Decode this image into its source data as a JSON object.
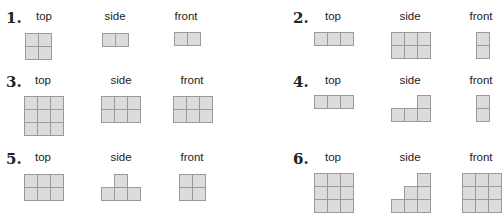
{
  "labels": {
    "top": "top",
    "side": "side",
    "front": "front"
  },
  "problems": [
    {
      "number": "1.",
      "num_pos": [
        6,
        9
      ],
      "label_y": 10,
      "views": [
        {
          "name": "top",
          "label_x": 44,
          "x": 25,
          "y": 33,
          "cells": [
            [
              0,
              0
            ],
            [
              1,
              0
            ],
            [
              0,
              1
            ],
            [
              1,
              1
            ]
          ]
        },
        {
          "name": "side",
          "label_x": 115,
          "x": 102,
          "y": 33,
          "cells": [
            [
              0,
              0
            ],
            [
              1,
              0
            ]
          ]
        },
        {
          "name": "front",
          "label_x": 186,
          "x": 174,
          "y": 32,
          "cells": [
            [
              0,
              0
            ],
            [
              1,
              0
            ]
          ]
        }
      ]
    },
    {
      "number": "2.",
      "num_pos": [
        293,
        9
      ],
      "label_y": 10,
      "views": [
        {
          "name": "top",
          "label_x": 333,
          "x": 314,
          "y": 32,
          "cells": [
            [
              0,
              0
            ],
            [
              1,
              0
            ],
            [
              2,
              0
            ]
          ]
        },
        {
          "name": "side",
          "label_x": 410,
          "x": 391,
          "y": 32,
          "cells": [
            [
              0,
              0
            ],
            [
              1,
              0
            ],
            [
              2,
              0
            ],
            [
              0,
              1
            ],
            [
              1,
              1
            ],
            [
              2,
              1
            ]
          ]
        },
        {
          "name": "front",
          "label_x": 481,
          "x": 476,
          "y": 32,
          "cells": [
            [
              0,
              0
            ],
            [
              0,
              1
            ]
          ]
        }
      ]
    },
    {
      "number": "3.",
      "num_pos": [
        6,
        73
      ],
      "label_y": 74,
      "views": [
        {
          "name": "top",
          "label_x": 43,
          "x": 24,
          "y": 96,
          "cells": [
            [
              0,
              0
            ],
            [
              1,
              0
            ],
            [
              2,
              0
            ],
            [
              0,
              1
            ],
            [
              1,
              1
            ],
            [
              2,
              1
            ],
            [
              0,
              2
            ],
            [
              1,
              2
            ],
            [
              2,
              2
            ]
          ]
        },
        {
          "name": "side",
          "label_x": 121,
          "x": 101,
          "y": 96,
          "cells": [
            [
              0,
              0
            ],
            [
              1,
              0
            ],
            [
              2,
              0
            ],
            [
              0,
              1
            ],
            [
              1,
              1
            ],
            [
              2,
              1
            ]
          ]
        },
        {
          "name": "front",
          "label_x": 192,
          "x": 173,
          "y": 96,
          "cells": [
            [
              0,
              0
            ],
            [
              1,
              0
            ],
            [
              2,
              0
            ],
            [
              0,
              1
            ],
            [
              1,
              1
            ],
            [
              2,
              1
            ]
          ]
        }
      ]
    },
    {
      "number": "4.",
      "num_pos": [
        293,
        73
      ],
      "label_y": 74,
      "views": [
        {
          "name": "top",
          "label_x": 333,
          "x": 314,
          "y": 95,
          "cells": [
            [
              0,
              0
            ],
            [
              1,
              0
            ],
            [
              2,
              0
            ]
          ]
        },
        {
          "name": "side",
          "label_x": 410,
          "x": 391,
          "y": 95,
          "cells": [
            [
              2,
              0
            ],
            [
              0,
              1
            ],
            [
              1,
              1
            ],
            [
              2,
              1
            ]
          ]
        },
        {
          "name": "front",
          "label_x": 481,
          "x": 476,
          "y": 95,
          "cells": [
            [
              0,
              0
            ],
            [
              0,
              1
            ]
          ]
        }
      ]
    },
    {
      "number": "5.",
      "num_pos": [
        6,
        150
      ],
      "label_y": 151,
      "views": [
        {
          "name": "top",
          "label_x": 43,
          "x": 24,
          "y": 174,
          "cells": [
            [
              0,
              0
            ],
            [
              1,
              0
            ],
            [
              2,
              0
            ],
            [
              0,
              1
            ],
            [
              1,
              1
            ],
            [
              2,
              1
            ]
          ]
        },
        {
          "name": "side",
          "label_x": 121,
          "x": 101,
          "y": 174,
          "cells": [
            [
              1,
              0
            ],
            [
              0,
              1
            ],
            [
              1,
              1
            ],
            [
              2,
              1
            ]
          ]
        },
        {
          "name": "front",
          "label_x": 192,
          "x": 179,
          "y": 174,
          "cells": [
            [
              0,
              0
            ],
            [
              1,
              0
            ],
            [
              0,
              1
            ],
            [
              1,
              1
            ]
          ]
        }
      ]
    },
    {
      "number": "6.",
      "num_pos": [
        293,
        150
      ],
      "label_y": 151,
      "views": [
        {
          "name": "top",
          "label_x": 333,
          "x": 314,
          "y": 173,
          "cells": [
            [
              0,
              0
            ],
            [
              1,
              0
            ],
            [
              2,
              0
            ],
            [
              0,
              1
            ],
            [
              1,
              1
            ],
            [
              2,
              1
            ],
            [
              0,
              2
            ],
            [
              1,
              2
            ],
            [
              2,
              2
            ]
          ]
        },
        {
          "name": "side",
          "label_x": 410,
          "x": 391,
          "y": 173,
          "cells": [
            [
              2,
              0
            ],
            [
              1,
              1
            ],
            [
              2,
              1
            ],
            [
              0,
              2
            ],
            [
              1,
              2
            ],
            [
              2,
              2
            ]
          ]
        },
        {
          "name": "front",
          "label_x": 481,
          "x": 462,
          "y": 173,
          "cells": [
            [
              0,
              0
            ],
            [
              1,
              0
            ],
            [
              2,
              0
            ],
            [
              0,
              1
            ],
            [
              1,
              1
            ],
            [
              2,
              1
            ],
            [
              0,
              2
            ],
            [
              1,
              2
            ],
            [
              2,
              2
            ]
          ]
        }
      ]
    }
  ]
}
